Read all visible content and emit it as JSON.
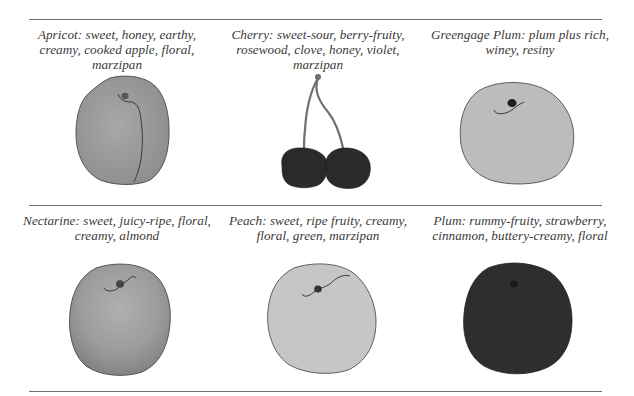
{
  "rules": [
    {
      "y": 19
    },
    {
      "y": 205
    },
    {
      "y": 391
    }
  ],
  "fruits": [
    {
      "name": "Apricot",
      "caption": "Apricot: sweet, honey, earthy, creamy, cooked apple, floral, marzipan",
      "fill": "#9c9c9c"
    },
    {
      "name": "Cherry",
      "caption": "Cherry: sweet-sour, berry-fruity, rosewood, clove, honey, violet, marzipan",
      "fill": "#2a2a2a"
    },
    {
      "name": "Greengage Plum",
      "caption": "Greengage Plum: plum plus rich, winey, resiny",
      "fill": "#bdbdbd"
    },
    {
      "name": "Nectarine",
      "caption": "Nectarine: sweet, juicy-ripe, floral, creamy, almond",
      "fill": "#9a9a9a"
    },
    {
      "name": "Peach",
      "caption": "Peach: sweet, ripe fruity, creamy, floral, green, marzipan",
      "fill": "#c6c6c6"
    },
    {
      "name": "Plum",
      "caption": "Plum: rummy-fruity, strawberry, cinnamon, buttery-creamy, floral",
      "fill": "#2e2e2e"
    }
  ]
}
